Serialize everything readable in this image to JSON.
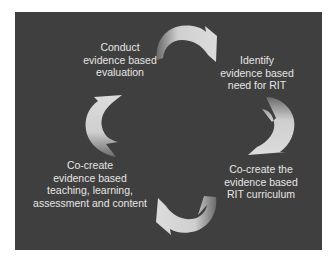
{
  "diagram": {
    "type": "cycle",
    "direction": "clockwise",
    "background_color": "#3f3f3f",
    "arrow_color": "#d4d4d4",
    "text_color": "#e6e6e6",
    "steps": [
      {
        "id": "evaluate",
        "lines": [
          "Conduct",
          "evidence based",
          "evaluation"
        ]
      },
      {
        "id": "identify",
        "lines": [
          "Identify",
          "evidence based",
          "need for RIT"
        ]
      },
      {
        "id": "curriculum",
        "lines": [
          "Co-create the",
          "evidence based",
          "RIT curriculum"
        ]
      },
      {
        "id": "teaching",
        "lines": [
          "Co-create",
          "evidence based",
          "teaching, learning,",
          "assessment and content"
        ]
      }
    ],
    "arrows": [
      {
        "from": "evaluate",
        "to": "identify"
      },
      {
        "from": "identify",
        "to": "curriculum"
      },
      {
        "from": "curriculum",
        "to": "teaching"
      },
      {
        "from": "teaching",
        "to": "evaluate"
      }
    ]
  }
}
